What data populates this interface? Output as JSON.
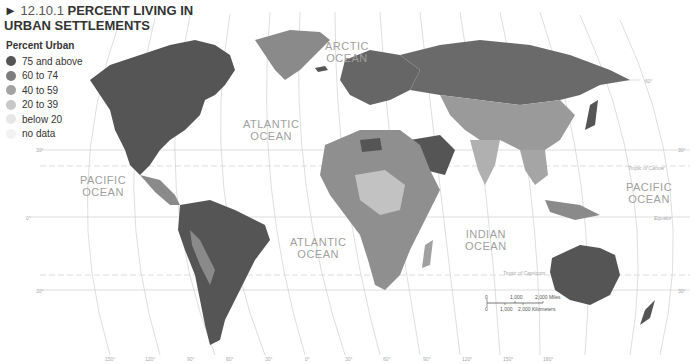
{
  "title": {
    "marker": "►",
    "number": "12.10.1",
    "line1": "PERCENT LIVING IN",
    "line2": "URBAN SETTLEMENTS"
  },
  "legend": {
    "heading": "Percent Urban",
    "items": [
      {
        "label": "75 and above",
        "color": "#555555"
      },
      {
        "label": "60 to 74",
        "color": "#7d7d7d"
      },
      {
        "label": "40 to 59",
        "color": "#a3a3a3"
      },
      {
        "label": "20 to 39",
        "color": "#c7c7c7"
      },
      {
        "label": "below 20",
        "color": "#e6e6e6"
      },
      {
        "label": "no data",
        "color": "#f2f2f2"
      }
    ]
  },
  "oceans": {
    "arctic": "ARCTIC OCEAN",
    "atlantic_north": "ATLANTIC OCEAN",
    "atlantic_south": "ATLANTIC OCEAN",
    "pacific_west": "PACIFIC OCEAN",
    "pacific_east": "PACIFIC OCEAN",
    "indian": "INDIAN OCEAN"
  },
  "ocean_lines": {
    "arctic1": "ARCTIC",
    "arctic2": "OCEAN",
    "atl_n1": "ATLANTIC",
    "atl_n2": "OCEAN",
    "atl_s1": "ATLANTIC",
    "atl_s2": "OCEAN",
    "pac_w1": "PACIFIC",
    "pac_w2": "OCEAN",
    "pac_e1": "PACIFIC",
    "pac_e2": "OCEAN",
    "ind1": "INDIAN",
    "ind2": "OCEAN"
  },
  "reference_lines": {
    "tropic_cancer": "Tropic of Cancer",
    "equator": "Equator",
    "tropic_capricorn": "Tropic of Capricorn"
  },
  "latitude_labels": {
    "n60": "60°",
    "n30": "30°",
    "eq": "0°",
    "s30": "30°"
  },
  "longitude_labels_bottom": [
    "150°",
    "120°",
    "90°",
    "60°",
    "30°",
    "0°",
    "30°",
    "60°",
    "90°",
    "120°",
    "150°",
    "180°"
  ],
  "longitude_labels_top": [
    "150°",
    "120°",
    "90°",
    "60°",
    "30°",
    "0°",
    "30°",
    "60°",
    "90°",
    "120°",
    "150°",
    "180°"
  ],
  "scale_bar": {
    "miles": [
      "0",
      "1,000",
      "2,000 Miles"
    ],
    "km": [
      "0",
      "1,000",
      "2,000 Kilometers"
    ]
  }
}
